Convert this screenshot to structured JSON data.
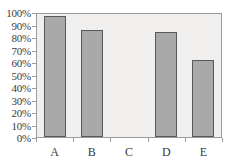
{
  "chart_data": {
    "type": "bar",
    "title": "",
    "subtitle": "",
    "xlabel": "",
    "ylabel": "",
    "categories": [
      "A",
      "B",
      "C",
      "D",
      "E"
    ],
    "values": [
      97,
      86,
      0,
      84,
      62
    ],
    "series": [
      {
        "name": "",
        "values": [
          97,
          86,
          0,
          84,
          62
        ]
      }
    ],
    "ylim": [
      0,
      100
    ],
    "y_tick_values": [
      100,
      90,
      80,
      70,
      60,
      50,
      40,
      30,
      20,
      10,
      0
    ],
    "y_tick_labels": [
      "100%",
      "90%",
      "80%",
      "70%",
      "60%",
      "50%",
      "40%",
      "30%",
      "20%",
      "10%",
      "0%"
    ],
    "value_suffix": "%",
    "grid": false,
    "legend": false,
    "legend_position": "none",
    "annotations": []
  },
  "style": {
    "bar_fill": "#a9a9a9",
    "bar_border": "#595959",
    "plot_background": "#f1f0ee",
    "canvas_background": "#ffffff",
    "frame_color": "#9a9a9a",
    "text_color": "#3a3a3a"
  }
}
